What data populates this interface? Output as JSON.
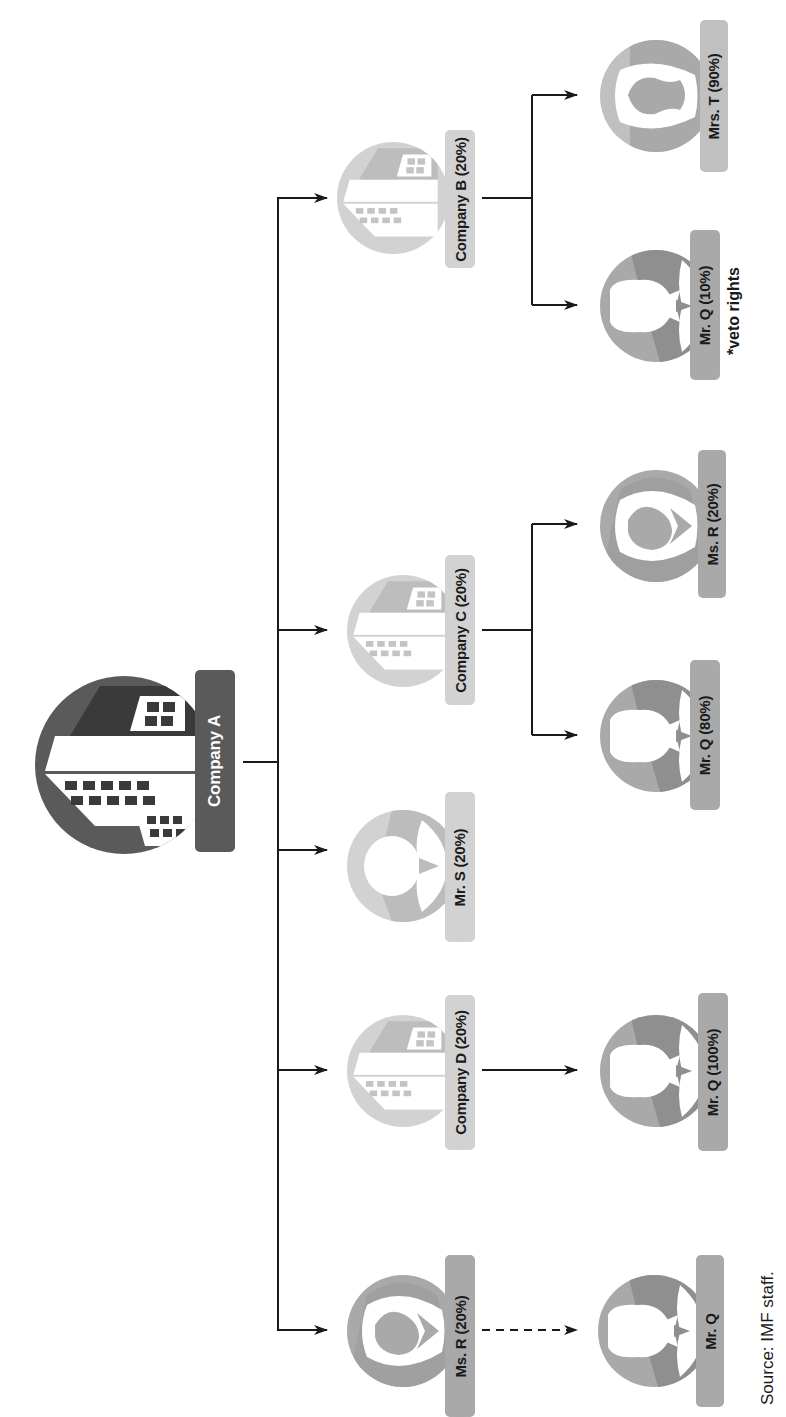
{
  "colors": {
    "dark": "#5a5a5a",
    "dark_accent": "#3a3a3a",
    "medium": "#9a9a9a",
    "medium_accent": "#7c7c7c",
    "light": "#c9c9c9",
    "light_accent": "#b2b2b2",
    "label_dark_text": "#ffffff",
    "label_text": "#1a1a1a",
    "line": "#1a1a1a"
  },
  "root": {
    "label": "Company A",
    "icon": "building-icon"
  },
  "level1": [
    {
      "id": "company-b",
      "label": "Company B (20%)",
      "icon": "building-icon",
      "shade": "light"
    },
    {
      "id": "company-c",
      "label": "Company C (20%)",
      "icon": "building-icon",
      "shade": "light"
    },
    {
      "id": "mr-s",
      "label": "Mr. S (20%)",
      "icon": "man-icon",
      "shade": "light"
    },
    {
      "id": "company-d",
      "label": "Company D (20%)",
      "icon": "building-icon",
      "shade": "light"
    },
    {
      "id": "ms-r",
      "label": "Ms. R (20%)",
      "icon": "woman-icon",
      "shade": "medium"
    }
  ],
  "level2": [
    {
      "id": "mrs-t",
      "parent": "company-b",
      "label": "Mrs. T (90%)",
      "icon": "woman-icon"
    },
    {
      "id": "mr-q-b",
      "parent": "company-b",
      "label": "Mr. Q (10%)",
      "icon": "man-icon",
      "note": "*veto rights"
    },
    {
      "id": "ms-r-c",
      "parent": "company-c",
      "label": "Ms. R (20%)",
      "icon": "woman-icon"
    },
    {
      "id": "mr-q-c",
      "parent": "company-c",
      "label": "Mr. Q (80%)",
      "icon": "man-icon"
    },
    {
      "id": "mr-q-d",
      "parent": "company-d",
      "label": "Mr. Q (100%)",
      "icon": "man-icon"
    },
    {
      "id": "mr-q-r",
      "parent": "ms-r",
      "label": "Mr. Q",
      "icon": "man-icon",
      "link": "dashed"
    }
  ],
  "source": "Source: IMF staff."
}
